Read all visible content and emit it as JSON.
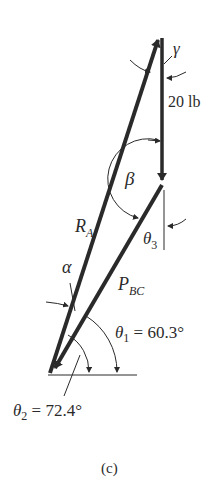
{
  "figure": {
    "caption": "(c)",
    "type": "force triangle"
  },
  "vectors": [
    {
      "name": "R_A",
      "label_main": "R",
      "label_sub": "A"
    },
    {
      "name": "P_BC",
      "label_main": "P",
      "label_sub": "BC"
    },
    {
      "name": "force_20lb",
      "label": "20 lb"
    }
  ],
  "angles": {
    "alpha": "α",
    "beta": "β",
    "gamma": "γ",
    "theta1": {
      "symbol": "θ",
      "sub": "1",
      "value": " = 60.3°"
    },
    "theta2": {
      "symbol": "θ",
      "sub": "2",
      "value": " = 72.4°"
    },
    "theta3": {
      "symbol": "θ",
      "sub": "3"
    }
  },
  "colors": {
    "stroke": "#2a2a2a",
    "background": "#ffffff"
  }
}
